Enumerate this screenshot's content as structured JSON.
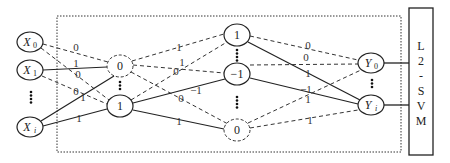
{
  "diagram": {
    "title": "",
    "input_layer": {
      "nodes": [
        {
          "id": "x0",
          "label": "X",
          "sub": "0",
          "cx": 30,
          "cy": 42
        },
        {
          "id": "x1",
          "label": "X",
          "sub": "1",
          "cx": 30,
          "cy": 70
        },
        {
          "id": "xi",
          "label": "X",
          "sub": "i",
          "cx": 30,
          "cy": 127
        }
      ],
      "ellipsis": "⋮"
    },
    "hidden_layer_1": {
      "nodes": [
        {
          "id": "h1a",
          "label": "0",
          "style": "dashed",
          "cx": 120,
          "cy": 66
        },
        {
          "id": "h1b",
          "label": "1",
          "style": "solid",
          "cx": 120,
          "cy": 106
        }
      ],
      "ellipsis": "⋮"
    },
    "hidden_layer_2": {
      "nodes": [
        {
          "id": "h2a",
          "label": "1",
          "style": "solid",
          "cx": 237,
          "cy": 35
        },
        {
          "id": "h2b",
          "label": "−1",
          "style": "solid",
          "cx": 237,
          "cy": 74
        },
        {
          "id": "h2c",
          "label": "0",
          "style": "dashed",
          "cx": 237,
          "cy": 130
        }
      ],
      "ellipsis": "⋮"
    },
    "output_layer": {
      "nodes": [
        {
          "id": "y0",
          "label": "Y",
          "sub": "0",
          "cx": 371,
          "cy": 63
        },
        {
          "id": "yi",
          "label": "Y",
          "sub": "i",
          "cx": 371,
          "cy": 105
        }
      ],
      "ellipsis": "⋮"
    },
    "classifier": {
      "label_letters": [
        "L",
        "2",
        "-",
        "S",
        "V",
        "M"
      ],
      "label": "L2-SVM"
    },
    "edges": [
      {
        "from": "x0",
        "to": "h1a",
        "weight": "0",
        "style": "dashed"
      },
      {
        "from": "x0",
        "to": "h1b",
        "weight": "0",
        "style": "dashed"
      },
      {
        "from": "x1",
        "to": "h1a",
        "weight": "1",
        "style": "solid"
      },
      {
        "from": "x1",
        "to": "h1b",
        "weight": "0",
        "style": "dashed"
      },
      {
        "from": "xi",
        "to": "h1a",
        "weight": "1",
        "style": "solid"
      },
      {
        "from": "xi",
        "to": "h1b",
        "weight": "1",
        "style": "solid"
      },
      {
        "from": "h1a",
        "to": "h2a",
        "weight": "1",
        "style": "dashed"
      },
      {
        "from": "h1a",
        "to": "h2b",
        "weight": "1",
        "style": "dashed"
      },
      {
        "from": "h1a",
        "to": "h2c",
        "weight": "0",
        "style": "dashed"
      },
      {
        "from": "h1b",
        "to": "h2a",
        "weight": "0",
        "style": "dashed"
      },
      {
        "from": "h1b",
        "to": "h2b",
        "weight": "−1",
        "style": "solid"
      },
      {
        "from": "h1b",
        "to": "h2c",
        "weight": "1",
        "style": "solid"
      },
      {
        "from": "h2a",
        "to": "y0",
        "weight": "0",
        "style": "dashed"
      },
      {
        "from": "h2a",
        "to": "yi",
        "weight": "1",
        "style": "solid"
      },
      {
        "from": "h2b",
        "to": "y0",
        "weight": "0",
        "style": "dashed"
      },
      {
        "from": "h2b",
        "to": "yi",
        "weight": "−1",
        "style": "solid"
      },
      {
        "from": "h2c",
        "to": "y0",
        "weight": "1",
        "style": "dashed"
      },
      {
        "from": "h2c",
        "to": "yi",
        "weight": "1",
        "style": "dashed"
      }
    ]
  },
  "labels": {
    "x0": "X",
    "x0_sub": "0",
    "x1": "X",
    "x1_sub": "1",
    "xi": "X",
    "xi_sub": "i",
    "h1a": "0",
    "h1b": "1",
    "h2a": "1",
    "h2b": "−1",
    "h2c": "0",
    "y0": "Y",
    "y0_sub": "0",
    "yi": "Y",
    "yi_sub": "i",
    "svm": [
      "L",
      "2",
      "-",
      "S",
      "V",
      "M"
    ],
    "w": {
      "x0_h1a": "0",
      "x1_h1a": "1",
      "x0_h1b": "0",
      "x1_h1b": "0",
      "xi_h1a": "1",
      "xi_h1b": "1",
      "h1a_h2a": "1",
      "h1a_h2b": "1",
      "h1b_h2a": "0",
      "h1a_h2c": "0",
      "h1b_h2b": "−1",
      "h1b_h2c": "1",
      "h2a_y0": "0",
      "h2b_y0": "0",
      "h2a_yi": "1",
      "h2b_yi": "−1",
      "h2c_y0": "1",
      "h2c_yi": "1"
    }
  }
}
